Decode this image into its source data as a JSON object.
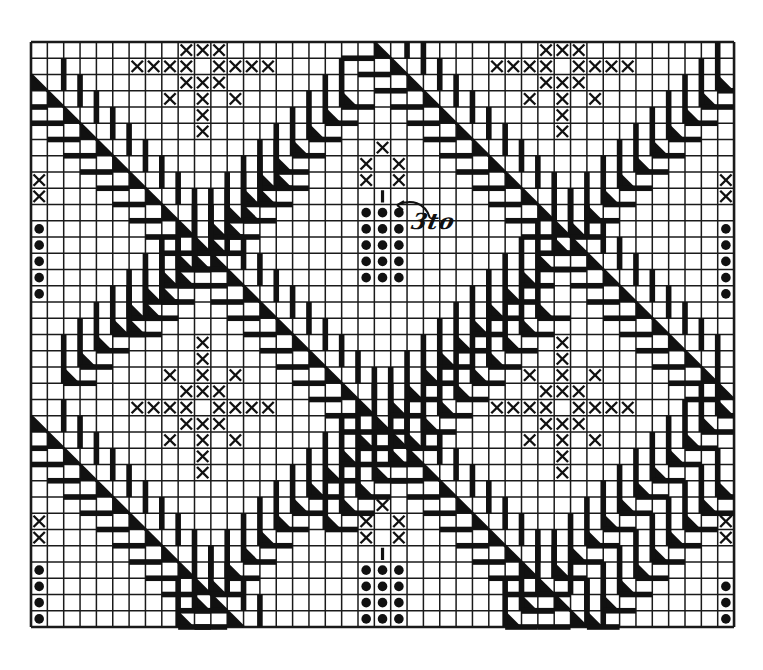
{
  "diagram": {
    "type": "knitting/lace chart grid",
    "colors": {
      "background": "#ffffff",
      "ink": "#111111",
      "grid": "#1a1a1a"
    },
    "grid": {
      "x0": 31,
      "y0": 42,
      "cols": 43,
      "rows": 36,
      "cell_w": 16.35,
      "cell_h": 16.25
    },
    "annotation": {
      "label": "3to",
      "arrow_from": [
        430,
        210
      ],
      "arrow_to": [
        397,
        205
      ]
    },
    "main_lines": [
      {
        "name": "main-diagonal-1",
        "start": [
          2,
          0
        ],
        "length": 34
      },
      {
        "name": "main-diagonal-2",
        "start": [
          0,
          21
        ],
        "length": 22
      },
      {
        "name": "main-diagonal-3",
        "start": [
          23,
          0
        ],
        "length": 13
      }
    ],
    "feather_chains": [
      {
        "name": "feather-chain-1",
        "start": [
          3,
          19
        ],
        "length": 18
      },
      {
        "name": "feather-chain-1b",
        "start": [
          8,
          15
        ],
        "length": 10
      },
      {
        "name": "feather-chain-2",
        "start": [
          2,
          42
        ],
        "length": 34
      },
      {
        "name": "feather-chain-2b",
        "start": [
          16,
          31
        ],
        "length": 14
      },
      {
        "name": "feather-chain-3",
        "start": [
          22,
          42
        ],
        "length": 14
      },
      {
        "name": "feather-chain-3b",
        "start": [
          27,
          42
        ],
        "length": 9
      }
    ],
    "cross_stitches": [
      [
        0,
        9
      ],
      [
        0,
        10
      ],
      [
        0,
        11
      ],
      [
        1,
        6
      ],
      [
        1,
        7
      ],
      [
        1,
        8
      ],
      [
        1,
        9
      ],
      [
        1,
        11
      ],
      [
        1,
        12
      ],
      [
        1,
        13
      ],
      [
        1,
        14
      ],
      [
        2,
        9
      ],
      [
        2,
        10
      ],
      [
        2,
        11
      ],
      [
        3,
        8
      ],
      [
        3,
        10
      ],
      [
        3,
        12
      ],
      [
        4,
        10
      ],
      [
        5,
        10
      ],
      [
        0,
        31
      ],
      [
        0,
        32
      ],
      [
        0,
        33
      ],
      [
        1,
        28
      ],
      [
        1,
        29
      ],
      [
        1,
        30
      ],
      [
        1,
        31
      ],
      [
        1,
        33
      ],
      [
        1,
        34
      ],
      [
        1,
        35
      ],
      [
        1,
        36
      ],
      [
        2,
        31
      ],
      [
        2,
        32
      ],
      [
        2,
        33
      ],
      [
        3,
        30
      ],
      [
        3,
        32
      ],
      [
        3,
        34
      ],
      [
        4,
        32
      ],
      [
        5,
        32
      ],
      [
        18,
        10
      ],
      [
        19,
        10
      ],
      [
        20,
        8
      ],
      [
        20,
        10
      ],
      [
        20,
        12
      ],
      [
        21,
        9
      ],
      [
        21,
        10
      ],
      [
        21,
        11
      ],
      [
        22,
        6
      ],
      [
        22,
        7
      ],
      [
        22,
        8
      ],
      [
        22,
        9
      ],
      [
        22,
        11
      ],
      [
        22,
        12
      ],
      [
        22,
        13
      ],
      [
        22,
        14
      ],
      [
        23,
        9
      ],
      [
        23,
        10
      ],
      [
        23,
        11
      ],
      [
        24,
        8
      ],
      [
        24,
        10
      ],
      [
        24,
        12
      ],
      [
        25,
        10
      ],
      [
        26,
        10
      ],
      [
        18,
        32
      ],
      [
        19,
        32
      ],
      [
        20,
        30
      ],
      [
        20,
        32
      ],
      [
        20,
        34
      ],
      [
        21,
        31
      ],
      [
        21,
        32
      ],
      [
        21,
        33
      ],
      [
        22,
        28
      ],
      [
        22,
        29
      ],
      [
        22,
        30
      ],
      [
        22,
        31
      ],
      [
        22,
        33
      ],
      [
        22,
        34
      ],
      [
        22,
        35
      ],
      [
        22,
        36
      ],
      [
        23,
        31
      ],
      [
        23,
        32
      ],
      [
        23,
        33
      ],
      [
        24,
        30
      ],
      [
        24,
        32
      ],
      [
        24,
        34
      ],
      [
        25,
        32
      ],
      [
        26,
        32
      ],
      [
        6,
        21
      ],
      [
        7,
        20
      ],
      [
        7,
        22
      ],
      [
        8,
        20
      ],
      [
        8,
        22
      ],
      [
        28,
        21
      ],
      [
        29,
        20
      ],
      [
        29,
        22
      ],
      [
        30,
        20
      ],
      [
        30,
        22
      ],
      [
        8,
        0
      ],
      [
        9,
        0
      ],
      [
        29,
        0
      ],
      [
        30,
        0
      ],
      [
        8,
        42
      ],
      [
        9,
        42
      ],
      [
        29,
        42
      ],
      [
        30,
        42
      ]
    ],
    "ticks": [
      [
        9,
        21
      ],
      [
        31,
        21
      ]
    ],
    "dots": [
      [
        10,
        20
      ],
      [
        10,
        21
      ],
      [
        10,
        22
      ],
      [
        11,
        20
      ],
      [
        11,
        21
      ],
      [
        11,
        22
      ],
      [
        12,
        20
      ],
      [
        12,
        21
      ],
      [
        12,
        22
      ],
      [
        13,
        20
      ],
      [
        13,
        21
      ],
      [
        13,
        22
      ],
      [
        14,
        20
      ],
      [
        14,
        21
      ],
      [
        14,
        22
      ],
      [
        32,
        20
      ],
      [
        32,
        21
      ],
      [
        32,
        22
      ],
      [
        33,
        20
      ],
      [
        33,
        21
      ],
      [
        33,
        22
      ],
      [
        34,
        20
      ],
      [
        34,
        21
      ],
      [
        34,
        22
      ],
      [
        35,
        20
      ],
      [
        35,
        21
      ],
      [
        35,
        22
      ],
      [
        11,
        0
      ],
      [
        12,
        0
      ],
      [
        13,
        0
      ],
      [
        14,
        0
      ],
      [
        15,
        0
      ],
      [
        32,
        0
      ],
      [
        33,
        0
      ],
      [
        34,
        0
      ],
      [
        35,
        0
      ],
      [
        11,
        42
      ],
      [
        12,
        42
      ],
      [
        13,
        42
      ],
      [
        14,
        42
      ],
      [
        15,
        42
      ],
      [
        33,
        42
      ],
      [
        34,
        42
      ],
      [
        35,
        42
      ]
    ]
  }
}
